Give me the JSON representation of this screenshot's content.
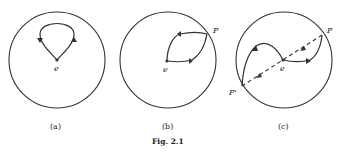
{
  "figure": {
    "caption": "Fig. 2.1",
    "panels": [
      {
        "id": "a",
        "label": "(a)",
        "point_label": "e"
      },
      {
        "id": "b",
        "label": "(b)",
        "point_label": "e",
        "boundary_label": "P"
      },
      {
        "id": "c",
        "label": "(c)",
        "point_label": "e",
        "boundary_label": "P",
        "antipode_label": "P'"
      }
    ]
  },
  "colors": {
    "stroke": "#333333",
    "background": "#ffffff"
  }
}
